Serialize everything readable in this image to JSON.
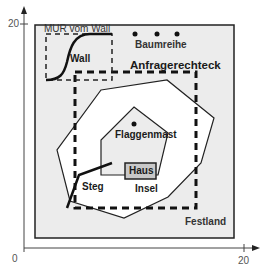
{
  "diagram": {
    "axes": {
      "y_max_label": "20",
      "x_max_label": "20",
      "origin_label": "0"
    },
    "regions": {
      "outer": "Festland",
      "query_rect": "Anfragerechteck",
      "mbr_label": "MUR vom Wall",
      "island": "Insel",
      "house": "Haus"
    },
    "features": {
      "wall": "Wall",
      "tree_row": "Baumreihe",
      "flagpole": "Flaggenmast",
      "jetty": "Steg"
    },
    "colors": {
      "mainland_fill": "#ececec",
      "lake_fill": "#ffffff",
      "island_fill": "#ececec",
      "house_fill": "#c8c8c8",
      "stroke": "#1a1a1a"
    }
  }
}
